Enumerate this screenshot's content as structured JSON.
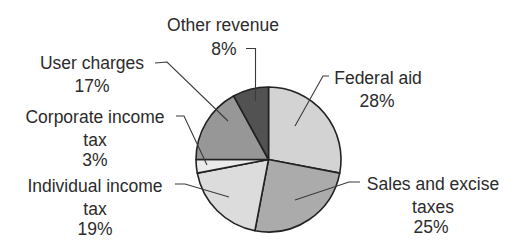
{
  "chart_data": {
    "type": "pie",
    "title": "",
    "start_angle_deg": 0,
    "direction": "clockwise",
    "slices": [
      {
        "label": "Federal aid",
        "label_lines": [
          "Federal aid"
        ],
        "value": 28,
        "value_label": "28%",
        "color": "#d3d3d3"
      },
      {
        "label": "Sales and excise taxes",
        "label_lines": [
          "Sales and excise",
          "taxes"
        ],
        "value": 25,
        "value_label": "25%",
        "color": "#ababab"
      },
      {
        "label": "Individual income tax",
        "label_lines": [
          "Individual income",
          "tax"
        ],
        "value": 19,
        "value_label": "19%",
        "color": "#dcdcdc"
      },
      {
        "label": "Corporate income tax",
        "label_lines": [
          "Corporate income",
          "tax"
        ],
        "value": 3,
        "value_label": "3%",
        "color": "#ebebeb"
      },
      {
        "label": "User charges",
        "label_lines": [
          "User charges"
        ],
        "value": 17,
        "value_label": "17%",
        "color": "#979797"
      },
      {
        "label": "Other revenue",
        "label_lines": [
          "Other revenue"
        ],
        "value": 8,
        "value_label": "8%",
        "color": "#525252"
      }
    ],
    "categories": [
      "Federal aid",
      "Sales and excise taxes",
      "Individual income tax",
      "Corporate income tax",
      "User charges",
      "Other revenue"
    ],
    "values": [
      28,
      25,
      19,
      3,
      17,
      8
    ],
    "unit": "%",
    "legend": "none (callout labels with leader lines)"
  },
  "labels": {
    "federal_aid": {
      "line1": "Federal aid",
      "pct": "28%"
    },
    "sales_excise": {
      "line1": "Sales and excise",
      "line2": "taxes",
      "pct": "25%"
    },
    "individual_income": {
      "line1": "Individual income",
      "line2": "tax",
      "pct": "19%"
    },
    "corporate_income": {
      "line1": "Corporate income",
      "line2": "tax",
      "pct": "3%"
    },
    "user_charges": {
      "line1": "User charges",
      "pct": "17%"
    },
    "other_revenue": {
      "line1": "Other revenue",
      "pct": "8%"
    }
  }
}
